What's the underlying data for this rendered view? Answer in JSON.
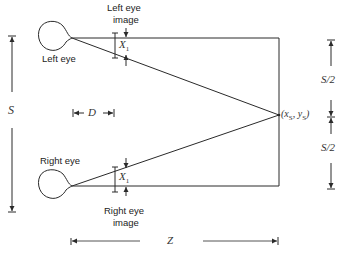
{
  "diagram": {
    "labels": {
      "left_eye": "Left eye",
      "right_eye": "Right eye",
      "left_eye_image": "Left eye\nimage",
      "left_eye_image_l1": "Left eye",
      "left_eye_image_l2": "image",
      "right_eye_image_l1": "Right eye",
      "right_eye_image_l2": "image",
      "x1_top": "X",
      "x1_top_sub": "1",
      "x1_bottom": "X",
      "x1_bottom_sub": "1",
      "s": "S",
      "d": "D",
      "z": "Z",
      "half_s_top": "S/2",
      "half_s_bottom": "S/2",
      "point_open": "(x",
      "point_sub1": "S",
      "point_mid": ", y",
      "point_sub2": "S",
      "point_close": ")"
    },
    "caption": "",
    "stroke_color": "#2a2a2a"
  }
}
